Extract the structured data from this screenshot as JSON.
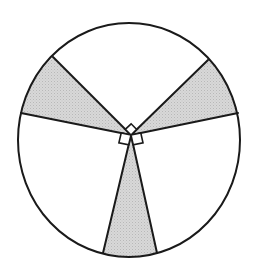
{
  "diagram": {
    "type": "circle-divided-into-sectors",
    "colors": {
      "stroke": "#1a1a1a",
      "shade": "#d2d2d2",
      "background": "#ffffff"
    },
    "circle": {
      "cx": 129,
      "cy": 140,
      "rx": 111,
      "ry": 117
    },
    "center": {
      "x": 131,
      "y": 135
    },
    "ray_endpoints": [
      {
        "id": "A",
        "x": 53,
        "y": 57
      },
      {
        "id": "B",
        "x": 21,
        "y": 113
      },
      {
        "id": "C",
        "x": 103,
        "y": 253
      },
      {
        "id": "D",
        "x": 157,
        "y": 253
      },
      {
        "id": "E",
        "x": 238,
        "y": 113
      },
      {
        "id": "F",
        "x": 208,
        "y": 60
      }
    ],
    "shaded_sectors": [
      {
        "name": "upper-left",
        "from": "A",
        "to": "B",
        "sweep": 0
      },
      {
        "name": "bottom",
        "from": "C",
        "to": "D",
        "sweep": 0
      },
      {
        "name": "upper-right",
        "from": "E",
        "to": "F",
        "sweep": 0
      }
    ],
    "right_angle_markers": [
      {
        "name": "top",
        "between": [
          "A",
          "F"
        ],
        "points": [
          [
            131,
            135
          ],
          [
            125.3,
            129.3
          ],
          [
            131.1,
            123.8
          ],
          [
            136.7,
            129.4
          ]
        ]
      },
      {
        "name": "lower-left",
        "between": [
          "B",
          "C"
        ],
        "points": [
          [
            131,
            135
          ],
          [
            121.2,
            133.0
          ],
          [
            118.9,
            142.8
          ],
          [
            128.7,
            144.7
          ]
        ]
      },
      {
        "name": "lower-right",
        "between": [
          "D",
          "E"
        ],
        "points": [
          [
            131,
            135
          ],
          [
            133.2,
            144.8
          ],
          [
            143.0,
            142.8
          ],
          [
            140.8,
            133.0
          ]
        ]
      }
    ]
  }
}
